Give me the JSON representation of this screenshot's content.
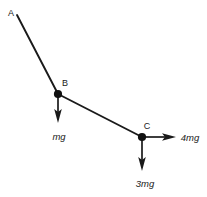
{
  "figure": {
    "type": "force-diagram",
    "background_color": "#ffffff",
    "ink_color": "#1a1a1a",
    "width": 207,
    "height": 197
  },
  "nodes": [
    {
      "id": "A",
      "label": "A",
      "x": 17,
      "y": 15,
      "label_x": 11,
      "label_y": 16,
      "has_joint_dot": false
    },
    {
      "id": "B",
      "label": "B",
      "x": 58,
      "y": 94,
      "label_x": 65,
      "label_y": 86,
      "has_joint_dot": true
    },
    {
      "id": "C",
      "label": "C",
      "x": 142,
      "y": 137,
      "label_x": 147,
      "label_y": 129,
      "has_joint_dot": true
    }
  ],
  "members": [
    {
      "id": "AB",
      "from": "A",
      "to": "B",
      "x1": 17,
      "y1": 15,
      "x2": 58,
      "y2": 94
    },
    {
      "id": "BC",
      "from": "B",
      "to": "C",
      "x1": 58,
      "y1": 94,
      "x2": 142,
      "y2": 137
    }
  ],
  "forces": [
    {
      "id": "force-at-B",
      "label": "mg",
      "at_node": "B",
      "direction": "down",
      "x1": 58,
      "y1": 94,
      "x2": 58,
      "y2": 122,
      "label_x": 59,
      "label_y": 140
    },
    {
      "id": "force-right-at-C",
      "label": "4mg",
      "at_node": "C",
      "direction": "right",
      "x1": 142,
      "y1": 137,
      "x2": 175,
      "y2": 137,
      "label_x": 190,
      "label_y": 141
    },
    {
      "id": "force-down-at-C",
      "label": "3mg",
      "at_node": "C",
      "direction": "down",
      "x1": 142,
      "y1": 137,
      "x2": 142,
      "y2": 170,
      "label_x": 145,
      "label_y": 187
    }
  ]
}
